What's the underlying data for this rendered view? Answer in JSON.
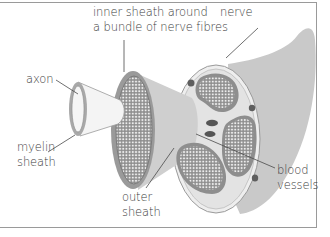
{
  "diagram": {
    "labels": {
      "inner_sheath": [
        "inner sheath around",
        "a bundle of nerve fibres"
      ],
      "nerve": [
        "nerve"
      ],
      "axon": [
        "axon"
      ],
      "myelin_sheath": [
        "myelin",
        "sheath"
      ],
      "outer_sheath": [
        "outer",
        "sheath"
      ],
      "blood_vessels": [
        "blood",
        "vessels"
      ]
    },
    "colors": {
      "nerve_body": "#c8c8c8",
      "bundle_fill": "#8e8e8e",
      "bundle_dots": "#e6e6e6",
      "blood_vessel": "#5a5a5a",
      "outer_sheath": "#ececec",
      "leader_line": "#4a4a4a",
      "text": "#3c3c3c",
      "border": "#9a9a9a"
    }
  }
}
